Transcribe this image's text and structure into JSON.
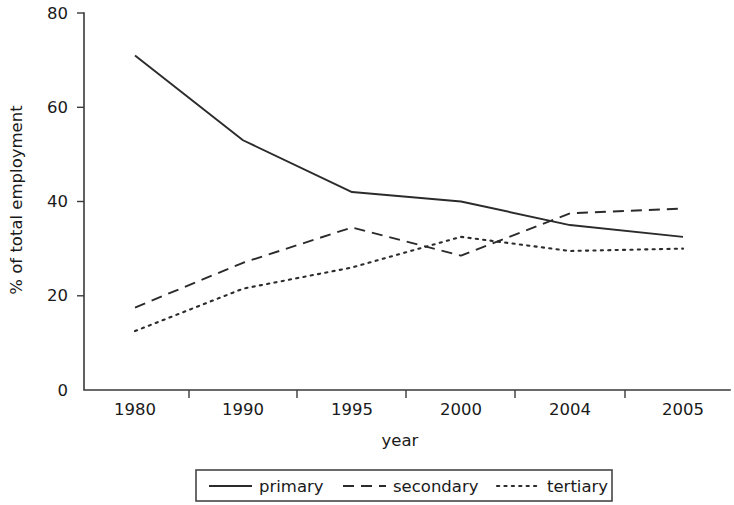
{
  "chart_data": {
    "type": "line",
    "title": "",
    "xlabel": "year",
    "ylabel": "% of total employment",
    "categories": [
      "1980",
      "1990",
      "1995",
      "2000",
      "2004",
      "2005"
    ],
    "xtick_labels": [
      "1980",
      "1990",
      "1995",
      "2000",
      "2004",
      "2005"
    ],
    "ytick_labels": [
      "0",
      "20",
      "40",
      "60",
      "80"
    ],
    "yticks": [
      0,
      20,
      40,
      60,
      80
    ],
    "ylim": [
      0,
      80
    ],
    "grid": false,
    "legend_position": "below-center",
    "series": [
      {
        "name": "primary",
        "style": "solid",
        "values": [
          71,
          53,
          42,
          40,
          35,
          32.5
        ]
      },
      {
        "name": "secondary",
        "style": "dashed",
        "values": [
          17.5,
          27,
          34.5,
          28.5,
          37.5,
          38.5
        ]
      },
      {
        "name": "tertiary",
        "style": "dotted",
        "values": [
          12.5,
          21.5,
          26,
          32.5,
          29.5,
          30
        ]
      }
    ]
  },
  "legend": {
    "items": [
      {
        "label": "primary",
        "style": "solid"
      },
      {
        "label": "secondary",
        "style": "dashed"
      },
      {
        "label": "tertiary",
        "style": "dotted"
      }
    ]
  },
  "colors": {
    "ink": "#2b2b2b",
    "axis": "#3a3a3a",
    "background": "#ffffff"
  }
}
